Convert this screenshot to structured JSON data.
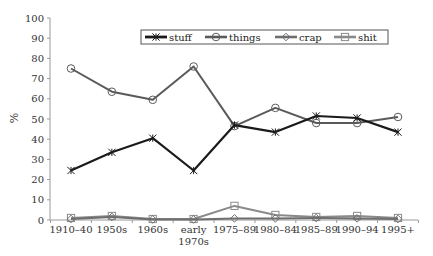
{
  "chart_data": {
    "type": "line",
    "title": "",
    "xlabel": "",
    "ylabel": "%",
    "ylim": [
      0,
      100
    ],
    "yticks": [
      0,
      10,
      20,
      30,
      40,
      50,
      60,
      70,
      80,
      90,
      100
    ],
    "grid": false,
    "legend_position": "top-center",
    "categories": [
      "1910–40",
      "1950s",
      "1960s",
      "early 1970s",
      "1975–89",
      "1980–84",
      "1985–89",
      "1990–94",
      "1995+"
    ],
    "category_lines": [
      [
        "1910–40"
      ],
      [
        "1950s"
      ],
      [
        "1960s"
      ],
      [
        "early",
        "1970s"
      ],
      [
        "1975–89"
      ],
      [
        "1980–84"
      ],
      [
        "1985–89"
      ],
      [
        "1990–94"
      ],
      [
        "1995+"
      ]
    ],
    "series": [
      {
        "name": "stuff",
        "color": "#1a1a1a",
        "marker": "x",
        "width": 2.2,
        "values": [
          24.5,
          33.5,
          40.5,
          24.5,
          47,
          43.5,
          51.5,
          50.5,
          43.5
        ]
      },
      {
        "name": "things",
        "color": "#5a5a5a",
        "marker": "circle",
        "width": 2.0,
        "values": [
          75,
          63.5,
          59.5,
          76,
          46.5,
          55.5,
          48,
          48,
          51
        ]
      },
      {
        "name": "crap",
        "color": "#6e6e6e",
        "marker": "diamond",
        "width": 2.0,
        "values": [
          0.5,
          1.5,
          0.3,
          0.3,
          0.8,
          0.8,
          1,
          0.8,
          0.5
        ]
      },
      {
        "name": "shit",
        "color": "#8a8a8a",
        "marker": "square",
        "width": 2.0,
        "values": [
          1,
          2,
          0.5,
          0.5,
          7,
          2.5,
          1.5,
          2,
          1
        ]
      }
    ]
  }
}
